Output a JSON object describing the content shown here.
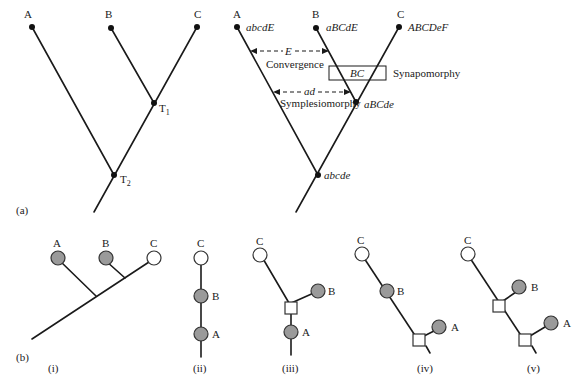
{
  "panel_a": {
    "label": "(a)",
    "left_tree": {
      "taxa": [
        "A",
        "B",
        "C"
      ],
      "nodes": [
        "T1",
        "T2"
      ],
      "node_labels": {
        "T1_main": "T",
        "T1_sub": "1",
        "T2_main": "T",
        "T2_sub": "2"
      }
    },
    "right_tree": {
      "taxa": [
        "A",
        "B",
        "C"
      ],
      "character_states": {
        "A": "abcdE",
        "B": "aBCdE",
        "C": "ABCDeF",
        "internal_BC": "aBCde",
        "root": "abcde"
      },
      "annotations": {
        "convergence_char": "E",
        "convergence_label": "Convergence",
        "synapomorphy_box": "BC",
        "synapomorphy_label": "Synapomorphy",
        "symplesiomorphy_char": "ad",
        "symplesiomorphy_label": "Symplesiomorphy"
      }
    }
  },
  "panel_b": {
    "label": "(b)",
    "subpanels": [
      {
        "id": "i",
        "caption": "(i)",
        "taxa": [
          "A",
          "B",
          "C"
        ]
      },
      {
        "id": "ii",
        "caption": "(ii)",
        "taxa": [
          "C",
          "B",
          "A"
        ]
      },
      {
        "id": "iii",
        "caption": "(iii)",
        "taxa": [
          "C",
          "B",
          "A"
        ]
      },
      {
        "id": "iv",
        "caption": "(iv)",
        "taxa": [
          "C",
          "B",
          "A"
        ]
      },
      {
        "id": "v",
        "caption": "(v)",
        "taxa": [
          "C",
          "B",
          "A"
        ]
      }
    ],
    "legend_colors": {
      "derived": "#9a9a9a",
      "ancestral": "#ffffff"
    }
  }
}
